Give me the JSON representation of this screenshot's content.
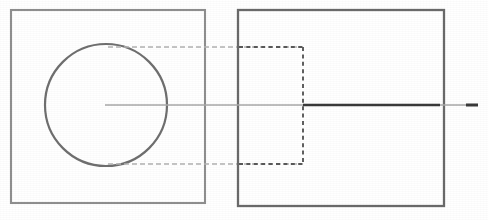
{
  "drawing": {
    "title": "Orthographic Engineering Drawing",
    "description": "Two-view technical drawing: front view with circular feature and side view with hidden counterbore",
    "canvas": {
      "width": 488,
      "height": 220,
      "background": "#ffffff"
    },
    "colors": {
      "object_line": "#8f8f8f",
      "object_line_dark": "#6a6a6a",
      "circle_line": "#6f6f6f",
      "hidden_line": "#595959",
      "projection_line": "#b2b2b2",
      "center_line": "#a8a8a8",
      "center_line_emphasis": "#3a3a3a",
      "background": "#ffffff"
    },
    "views": {
      "front": {
        "name": "front-view",
        "label": "Front View",
        "outline": {
          "x": 11,
          "y": 10,
          "width": 194,
          "height": 193
        },
        "circle": {
          "cx": 106,
          "cy": 105,
          "r": 61
        }
      },
      "side": {
        "name": "side-view",
        "label": "Side View",
        "outline": {
          "x": 238,
          "y": 10,
          "width": 206,
          "height": 196
        },
        "hidden_feature": {
          "x": 239,
          "y": 47,
          "width": 64,
          "height": 117
        }
      }
    },
    "center_line": {
      "name": "horizontal-centerline",
      "label": "Centerline",
      "y": 105,
      "x_start": 105,
      "x_end": 478,
      "emphasis_x_start": 303,
      "emphasis_x_end": 440,
      "tip_x_start": 466,
      "tip_x_end": 478
    },
    "projection_lines": [
      {
        "name": "projection-line-top",
        "label": "Top Projection Line",
        "y": 47,
        "x_start": 108,
        "x_end": 303
      },
      {
        "name": "projection-line-bottom",
        "label": "Bottom Projection Line",
        "y": 164,
        "x_start": 108,
        "x_end": 303
      }
    ]
  }
}
